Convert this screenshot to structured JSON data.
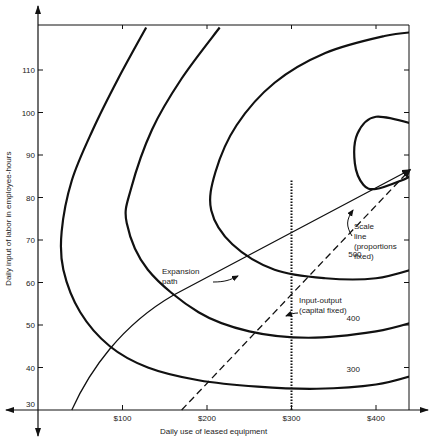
{
  "chart_data": {
    "type": "line",
    "title": "",
    "xlabel": "Daily use of leased equipment",
    "ylabel": "Daily input of labor in employee-hours",
    "xlim": [
      0,
      450
    ],
    "ylim": [
      30,
      120
    ],
    "x_ticks": [
      {
        "value": 100,
        "label": "$100"
      },
      {
        "value": 200,
        "label": "$200"
      },
      {
        "value": 300,
        "label": "$300"
      },
      {
        "value": 400,
        "label": "$400"
      }
    ],
    "y_ticks": [
      {
        "value": 40,
        "label": "40"
      },
      {
        "value": 50,
        "label": "50"
      },
      {
        "value": 60,
        "label": "60"
      },
      {
        "value": 70,
        "label": "70"
      },
      {
        "value": 80,
        "label": "80"
      },
      {
        "value": 90,
        "label": "90"
      },
      {
        "value": 100,
        "label": "100"
      },
      {
        "value": 110,
        "label": "110"
      }
    ],
    "y_origin_label": "30",
    "grid": false,
    "isoquants": [
      {
        "name": "300",
        "label": "300",
        "points": [
          [
            300,
            36.5
          ],
          [
            420,
            36.5
          ],
          [
            450,
            38
          ],
          [
            345,
            37
          ],
          [
            260,
            36
          ],
          [
            180,
            36.5
          ],
          [
            120,
            38
          ],
          [
            70,
            42
          ],
          [
            30,
            56
          ],
          [
            20,
            68
          ],
          [
            30,
            82
          ],
          [
            60,
            98
          ],
          [
            95,
            110
          ],
          [
            130,
            120
          ]
        ]
      },
      {
        "name": "400",
        "label": "400",
        "points": [
          [
            450,
            51
          ],
          [
            400,
            48.5
          ],
          [
            320,
            47
          ],
          [
            250,
            48.5
          ],
          [
            190,
            53
          ],
          [
            130,
            63
          ],
          [
            105,
            74
          ],
          [
            110,
            82
          ],
          [
            135,
            96
          ],
          [
            170,
            108
          ],
          [
            215,
            120
          ]
        ]
      },
      {
        "name": "500",
        "label": "500",
        "points": [
          [
            450,
            63.5
          ],
          [
            400,
            61
          ],
          [
            340,
            61
          ],
          [
            280,
            63
          ],
          [
            230,
            69
          ],
          [
            205,
            77
          ],
          [
            210,
            86
          ],
          [
            235,
            97
          ],
          [
            280,
            107
          ],
          [
            340,
            114
          ],
          [
            410,
            118
          ],
          [
            450,
            119
          ]
        ]
      },
      {
        "name": "inner",
        "label": "",
        "points": [
          [
            450,
            86
          ],
          [
            430,
            84
          ],
          [
            400,
            82
          ],
          [
            385,
            83
          ],
          [
            375,
            88
          ],
          [
            378,
            95
          ],
          [
            400,
            99
          ],
          [
            450,
            97
          ]
        ]
      }
    ],
    "lines": [
      {
        "name": "Expansion path",
        "label": "Expansion path",
        "style": "solid",
        "from": [
          40,
          30
        ],
        "to": [
          445,
          87
        ]
      },
      {
        "name": "Scale line",
        "label": "Scale line (proportions fixed)",
        "style": "dashed",
        "from": [
          170,
          30
        ],
        "to": [
          445,
          87
        ]
      },
      {
        "name": "Input-output",
        "label": "Input-output (capital fixed)",
        "style": "dotted",
        "x": 300,
        "from_y": 30,
        "to_y": 84
      }
    ],
    "annotations": [
      {
        "text_lines": [
          "Expansion",
          "path"
        ],
        "points_to": "Expansion path"
      },
      {
        "text_lines": [
          "Scale",
          "line",
          "(proportions",
          "fixed)"
        ],
        "points_to": "Scale line"
      },
      {
        "text_lines": [
          "Input-output",
          "(capital fixed)"
        ],
        "points_to": "Input-output"
      }
    ]
  }
}
